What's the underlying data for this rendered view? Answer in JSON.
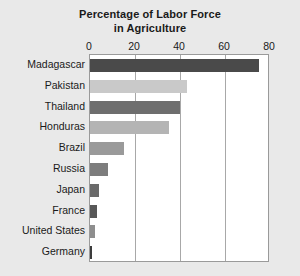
{
  "chart_data": {
    "type": "bar",
    "orientation": "horizontal",
    "title": "Percentage of Labor Force in Agriculture",
    "title_lines": [
      "Percentage of Labor Force",
      "in Agriculture"
    ],
    "xlabel": "",
    "ylabel": "",
    "categories": [
      "Madagascar",
      "Pakistan",
      "Thailand",
      "Honduras",
      "Brazil",
      "Russia",
      "Japan",
      "France",
      "United States",
      "Germany"
    ],
    "values": [
      75,
      43,
      40,
      35,
      15,
      8,
      4,
      3,
      2,
      1
    ],
    "xlim": [
      0,
      80
    ],
    "xticks": [
      0,
      20,
      40,
      60,
      80
    ],
    "xtick_labels": [
      "0",
      "20",
      "40",
      "60",
      "80"
    ],
    "grid": true,
    "grid_axis": "x",
    "legend": false,
    "bar_colors": [
      "#4a4a4a",
      "#c9c9c9",
      "#6e6e6e",
      "#b4b4b4",
      "#9a9a9a",
      "#7d7d7d",
      "#6a6a6a",
      "#585858",
      "#8e8e8e",
      "#3c3c3c"
    ]
  },
  "figure": {
    "background_color": "#e9e9e9",
    "plot_background_color": "#ffffff",
    "frame_color": "#9a9a9a",
    "gridline_color": "#a8a8a8",
    "text_color": "#1a1a1a"
  }
}
